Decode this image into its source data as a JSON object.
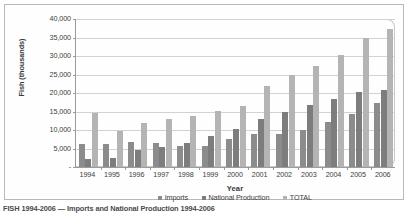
{
  "chart_data": {
    "type": "bar",
    "title": "",
    "xlabel": "Year",
    "ylabel": "Fish (thousands)",
    "ylim": [
      0,
      40000
    ],
    "ytick_labels": [
      "40,000",
      "35,000",
      "30,000",
      "25,000",
      "20,000",
      "15,000",
      "10,000",
      "5,000",
      "-"
    ],
    "ytick_values": [
      40000,
      35000,
      30000,
      25000,
      20000,
      15000,
      10000,
      5000,
      0
    ],
    "grid": true,
    "legend_position": "bottom",
    "categories": [
      "1994",
      "1995",
      "1996",
      "1997",
      "1998",
      "1999",
      "2000",
      "2001",
      "2002",
      "2003",
      "2004",
      "2005",
      "2006"
    ],
    "series": [
      {
        "name": "Imports",
        "color": "#8c8c8c",
        "values": [
          6200,
          6300,
          6800,
          6400,
          5600,
          5700,
          7700,
          8800,
          9000,
          10000,
          12300,
          14400,
          17300
        ]
      },
      {
        "name": "National Production",
        "color": "#7d7d7d",
        "values": [
          2100,
          2500,
          4500,
          5300,
          6400,
          8500,
          10200,
          13100,
          14900,
          16700,
          18400,
          20400,
          20900
        ]
      },
      {
        "name": "TOTAL",
        "color": "#b4b4b4",
        "values": [
          14600,
          9700,
          11900,
          13000,
          13900,
          15100,
          16600,
          21900,
          25000,
          27200,
          30200,
          34900,
          37400
        ]
      }
    ]
  },
  "axes": {
    "y_title": "Fish (thousands)",
    "x_title": "Year"
  },
  "legend": {
    "items": [
      {
        "label": "Imports",
        "color": "#8c8c8c"
      },
      {
        "label": "National Production",
        "color": "#7d7d7d"
      },
      {
        "label": "TOTAL",
        "color": "#b4b4b4"
      }
    ]
  },
  "caption": {
    "text": "FISH 1994-2006 — Imports and National Production 1994-2006"
  }
}
